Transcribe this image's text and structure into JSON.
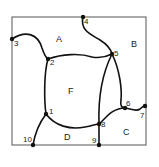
{
  "diagram": {
    "type": "planar-map-graph",
    "colors": {
      "stroke": "#111111",
      "border": "#555555",
      "background": "#ffffff"
    },
    "border": {
      "x": 12,
      "y": 17,
      "width": 134,
      "height": 128
    },
    "nodes": [
      {
        "id": "1",
        "label": "1",
        "x": 46,
        "y": 114
      },
      {
        "id": "2",
        "label": "2",
        "x": 48,
        "y": 59
      },
      {
        "id": "3",
        "label": "3",
        "x": 12,
        "y": 39
      },
      {
        "id": "4",
        "label": "4",
        "x": 83,
        "y": 17
      },
      {
        "id": "5",
        "label": "5",
        "x": 112,
        "y": 54
      },
      {
        "id": "6",
        "label": "6",
        "x": 125,
        "y": 108
      },
      {
        "id": "7",
        "label": "7",
        "x": 145,
        "y": 106
      },
      {
        "id": "8",
        "label": "8",
        "x": 99,
        "y": 124
      },
      {
        "id": "9",
        "label": "9",
        "x": 99,
        "y": 145
      },
      {
        "id": "10",
        "label": "10",
        "x": 33,
        "y": 145
      }
    ],
    "regions": [
      {
        "id": "A",
        "label": "A",
        "x": 59,
        "y": 42
      },
      {
        "id": "B",
        "label": "B",
        "x": 134,
        "y": 47
      },
      {
        "id": "C",
        "label": "C",
        "x": 126,
        "y": 135
      },
      {
        "id": "D",
        "label": "D",
        "x": 67,
        "y": 140
      },
      {
        "id": "F",
        "label": "F",
        "x": 71,
        "y": 94
      }
    ],
    "edges": [
      {
        "from": "3",
        "to": "2"
      },
      {
        "from": "2",
        "to": "5"
      },
      {
        "from": "4",
        "to": "5"
      },
      {
        "from": "2",
        "to": "1"
      },
      {
        "from": "1",
        "to": "10"
      },
      {
        "from": "1",
        "to": "8"
      },
      {
        "from": "5",
        "to": "8"
      },
      {
        "from": "5",
        "to": "6"
      },
      {
        "from": "8",
        "to": "6"
      },
      {
        "from": "6",
        "to": "7"
      },
      {
        "from": "8",
        "to": "9"
      }
    ]
  }
}
